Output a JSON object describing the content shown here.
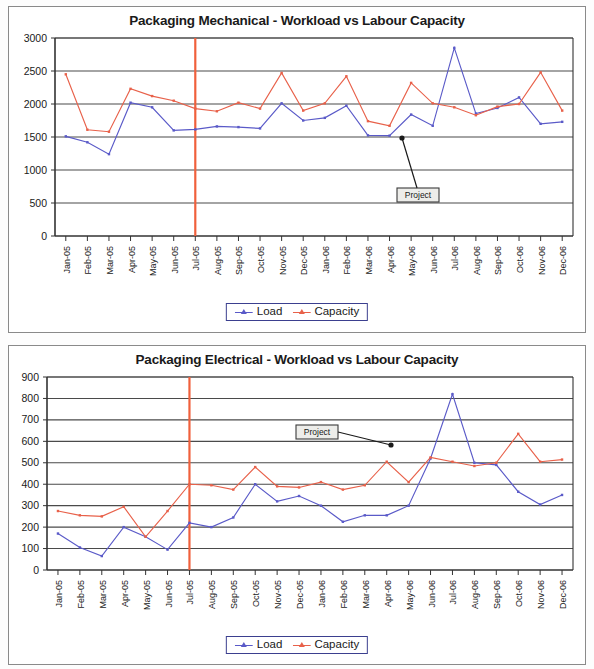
{
  "page": {
    "background_color": "#fdfdfd",
    "panel_border_color": "#8a8a8a"
  },
  "colors": {
    "load": "#5a5ac8",
    "capacity": "#e8614a",
    "marker_line": "#f0603c",
    "gridline": "#4a4a4a",
    "axis": "#333333",
    "legend_border": "#3b3f8f",
    "callout_border": "#3a3a3a",
    "callout_fill": "#ededea",
    "text": "#1a1a1a"
  },
  "charts": [
    {
      "id": "packaging-mechanical",
      "title": "Packaging Mechanical - Workload vs Labour Capacity",
      "callout": {
        "label": "Project"
      },
      "legend": [
        {
          "name": "Load",
          "color": "#5a5ac8",
          "marker": "triangle"
        },
        {
          "name": "Capacity",
          "color": "#e8614a",
          "marker": "triangle"
        }
      ],
      "chart_data": {
        "type": "line",
        "title": "Packaging Mechanical - Workload vs Labour Capacity",
        "xlabel": "",
        "ylabel": "",
        "ylim": [
          0,
          3000
        ],
        "ytick_step": 500,
        "yticks": [
          0,
          500,
          1000,
          1500,
          2000,
          2500,
          3000
        ],
        "grid": true,
        "legend_position": "bottom",
        "marker_line_x": "Jul-05",
        "categories": [
          "Jan-05",
          "Feb-05",
          "Mar-05",
          "Apr-05",
          "May-05",
          "Jun-05",
          "Jul-05",
          "Aug-05",
          "Sep-05",
          "Oct-05",
          "Nov-05",
          "Dec-05",
          "Jan-06",
          "Feb-06",
          "Mar-06",
          "Apr-06",
          "May-06",
          "Jun-06",
          "Jul-06",
          "Aug-06",
          "Sep-06",
          "Oct-06",
          "Nov-06",
          "Dec-06"
        ],
        "series": [
          {
            "name": "Load",
            "color": "#5a5ac8",
            "values": [
              1510,
              1420,
              1240,
              2020,
              1950,
              1600,
              1615,
              1660,
              1650,
              1630,
              2010,
              1750,
              1790,
              1975,
              1525,
              1520,
              1840,
              1670,
              2850,
              1855,
              1940,
              2100,
              1700,
              1730
            ]
          },
          {
            "name": "Capacity",
            "color": "#e8614a",
            "values": [
              2450,
              1610,
              1580,
              2230,
              2120,
              2050,
              1930,
              1890,
              2020,
              1930,
              2470,
              1900,
              2010,
              2420,
              1740,
              1670,
              2320,
              2010,
              1950,
              1830,
              1960,
              2000,
              2480,
              1900
            ]
          }
        ]
      }
    },
    {
      "id": "packaging-electrical",
      "title": "Packaging Electrical - Workload vs Labour Capacity",
      "callout": {
        "label": "Project"
      },
      "legend": [
        {
          "name": "Load",
          "color": "#5a5ac8",
          "marker": "triangle"
        },
        {
          "name": "Capacity",
          "color": "#e8614a",
          "marker": "triangle"
        }
      ],
      "chart_data": {
        "type": "line",
        "title": "Packaging Electrical - Workload vs Labour Capacity",
        "xlabel": "",
        "ylabel": "",
        "ylim": [
          0,
          900
        ],
        "ytick_step": 100,
        "yticks": [
          0,
          100,
          200,
          300,
          400,
          500,
          600,
          700,
          800,
          900
        ],
        "grid": true,
        "legend_position": "bottom",
        "marker_line_x": "Jul-05",
        "categories": [
          "Jan-05",
          "Feb-05",
          "Mar-05",
          "Apr-05",
          "May-05",
          "Jun-05",
          "Jul-05",
          "Aug-05",
          "Sep-05",
          "Oct-05",
          "Nov-05",
          "Dec-05",
          "Jan-06",
          "Feb-06",
          "Mar-06",
          "Apr-06",
          "May-06",
          "Jun-06",
          "Jul-06",
          "Aug-06",
          "Sep-06",
          "Oct-06",
          "Nov-06",
          "Dec-06"
        ],
        "series": [
          {
            "name": "Load",
            "color": "#5a5ac8",
            "values": [
              170,
              105,
              65,
              200,
              155,
              95,
              220,
              200,
              245,
              400,
              320,
              345,
              300,
              225,
              255,
              255,
              300,
              520,
              820,
              500,
              490,
              365,
              305,
              350
            ]
          },
          {
            "name": "Capacity",
            "color": "#e8614a",
            "values": [
              275,
              255,
              250,
              295,
              155,
              275,
              400,
              395,
              375,
              480,
              390,
              385,
              410,
              375,
              395,
              505,
              410,
              525,
              505,
              485,
              500,
              635,
              505,
              515
            ]
          }
        ]
      }
    }
  ]
}
